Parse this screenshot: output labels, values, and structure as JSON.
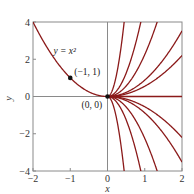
{
  "chart_data": {
    "type": "line",
    "title": "",
    "xlabel": "x",
    "ylabel": "y",
    "xlim": [
      -2,
      2
    ],
    "ylim": [
      -4,
      4
    ],
    "grid": false,
    "axes_lines_at_zero": true,
    "x_ticks": [
      -2,
      -1,
      0,
      1,
      2
    ],
    "x_tick_labels": [
      "−2",
      "−1",
      "0",
      "1",
      "2"
    ],
    "y_ticks": [
      -4,
      -2,
      0,
      2,
      4
    ],
    "y_tick_labels": [
      "−4",
      "−2",
      "0",
      "2",
      "4"
    ],
    "series": [
      {
        "name": "y = x^2 (left branch)",
        "formula": "y = x^2",
        "domain": [
          -2,
          0
        ],
        "C": 1
      },
      {
        "name": "y = 20x^2",
        "formula": "y = C x^2",
        "domain": [
          0,
          2
        ],
        "C": 20
      },
      {
        "name": "y = 5x^2",
        "formula": "y = C x^2",
        "domain": [
          0,
          2
        ],
        "C": 5
      },
      {
        "name": "y = 2.25x^2",
        "formula": "y = C x^2",
        "domain": [
          0,
          2
        ],
        "C": 2.25
      },
      {
        "name": "y = 0.88x^2",
        "formula": "y = C x^2",
        "domain": [
          0,
          2
        ],
        "C": 0.88
      },
      {
        "name": "y = 0.55x^2",
        "formula": "y = C x^2",
        "domain": [
          0,
          2
        ],
        "C": 0.55
      },
      {
        "name": "y = 0",
        "formula": "y = C x^2",
        "domain": [
          0,
          2
        ],
        "C": 0
      },
      {
        "name": "y = -0.55x^2",
        "formula": "y = C x^2",
        "domain": [
          0,
          2
        ],
        "C": -0.55
      },
      {
        "name": "y = -0.88x^2",
        "formula": "y = C x^2",
        "domain": [
          0,
          2
        ],
        "C": -0.88
      },
      {
        "name": "y = -2.25x^2",
        "formula": "y = C x^2",
        "domain": [
          0,
          2
        ],
        "C": -2.25
      },
      {
        "name": "y = -5x^2",
        "formula": "y = C x^2",
        "domain": [
          0,
          2
        ],
        "C": -5
      },
      {
        "name": "y = -20x^2",
        "formula": "y = C x^2",
        "domain": [
          0,
          2
        ],
        "C": -20
      }
    ],
    "points": [
      {
        "x": -1,
        "y": 1,
        "label": "(−1, 1)"
      },
      {
        "x": 0,
        "y": 0,
        "label": "(0, 0)"
      }
    ],
    "annotations": [
      {
        "text": "y = x²",
        "x": -1.45,
        "y": 2.3
      }
    ],
    "curve_color": "#8b1a1a",
    "frame_color": "#8a8a8a"
  }
}
